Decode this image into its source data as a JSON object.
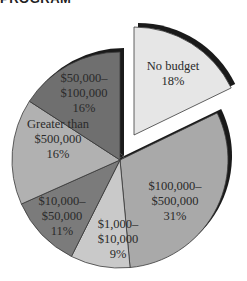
{
  "title": "PROGRAM",
  "chart_data": {
    "type": "pie",
    "title": "PROGRAM",
    "categories": [
      "No budget",
      "$100,000–$500,000",
      "$1,000–$10,000",
      "$10,000–$50,000",
      "Greater than $500,000",
      "$50,000–$100,000"
    ],
    "values": [
      18,
      31,
      9,
      11,
      16,
      16
    ],
    "units": "%",
    "exploded": [
      "No budget"
    ],
    "colors": [
      "#e6e6e6",
      "#a9a9a9",
      "#c9c9c9",
      "#7b7b7b",
      "#b1b1b1",
      "#6f6f6f"
    ],
    "shadow_color": "#1a1a1a",
    "labels": [
      {
        "lines": [
          "No budget",
          "18%"
        ]
      },
      {
        "lines": [
          "$100,000–",
          "$500,000",
          "31%"
        ]
      },
      {
        "lines": [
          "$1,000–",
          "$10,000",
          "9%"
        ]
      },
      {
        "lines": [
          "$10,000–",
          "$50,000",
          "11%"
        ]
      },
      {
        "lines": [
          "Greater than",
          "$500,000",
          "16%"
        ]
      },
      {
        "lines": [
          "$50,000–",
          "$100,000",
          "16%"
        ]
      }
    ],
    "legend": "none",
    "grid": false
  }
}
